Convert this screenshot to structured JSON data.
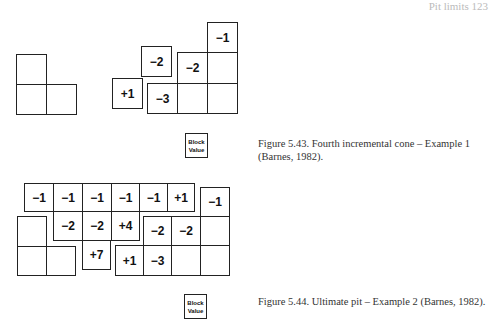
{
  "page_header": "Pit limits 123",
  "figure_1": {
    "caption": "Figure 5.43.  Fourth incremental cone – Example 1 (Barnes, 1982).",
    "legend": {
      "line1": "Block",
      "line2": "Value"
    },
    "cells": [
      {
        "x": 16,
        "y": 54,
        "w": 31,
        "h": 31,
        "label": ""
      },
      {
        "x": 16,
        "y": 84,
        "w": 31,
        "h": 31,
        "label": ""
      },
      {
        "x": 46,
        "y": 84,
        "w": 31,
        "h": 31,
        "label": ""
      },
      {
        "x": 112,
        "y": 78,
        "w": 31,
        "h": 31,
        "label": "+1"
      },
      {
        "x": 141,
        "y": 46,
        "w": 31,
        "h": 31,
        "label": "−2"
      },
      {
        "x": 147,
        "y": 83,
        "w": 31,
        "h": 31,
        "label": "−3"
      },
      {
        "x": 177,
        "y": 52,
        "w": 31,
        "h": 32,
        "label": "−2"
      },
      {
        "x": 177,
        "y": 83,
        "w": 31,
        "h": 31,
        "label": ""
      },
      {
        "x": 207,
        "y": 22,
        "w": 31,
        "h": 31,
        "label": "−1"
      },
      {
        "x": 207,
        "y": 52,
        "w": 31,
        "h": 32,
        "label": ""
      },
      {
        "x": 207,
        "y": 83,
        "w": 31,
        "h": 31,
        "label": ""
      }
    ]
  },
  "figure_2": {
    "caption": "Figure 5.44.  Ultimate pit – Example 2 (Barnes, 1982).",
    "legend": {
      "line1": "Block",
      "line2": "Value"
    },
    "cells": [
      {
        "x": 24,
        "y": 183,
        "w": 30,
        "h": 29,
        "label": "−1"
      },
      {
        "x": 53,
        "y": 183,
        "w": 30,
        "h": 29,
        "label": "−1"
      },
      {
        "x": 82,
        "y": 183,
        "w": 30,
        "h": 29,
        "label": "−1"
      },
      {
        "x": 111,
        "y": 183,
        "w": 29,
        "h": 29,
        "label": "−1"
      },
      {
        "x": 139,
        "y": 183,
        "w": 29,
        "h": 29,
        "label": "−1"
      },
      {
        "x": 167,
        "y": 183,
        "w": 28,
        "h": 29,
        "label": "+1"
      },
      {
        "x": 200,
        "y": 187,
        "w": 30,
        "h": 30,
        "label": "−1"
      },
      {
        "x": 17,
        "y": 216,
        "w": 30,
        "h": 31,
        "label": ""
      },
      {
        "x": 53,
        "y": 211,
        "w": 30,
        "h": 30,
        "label": "−2"
      },
      {
        "x": 82,
        "y": 211,
        "w": 30,
        "h": 30,
        "label": "−2"
      },
      {
        "x": 111,
        "y": 211,
        "w": 29,
        "h": 30,
        "label": "+4"
      },
      {
        "x": 143,
        "y": 216,
        "w": 29,
        "h": 30,
        "label": "−2"
      },
      {
        "x": 171,
        "y": 216,
        "w": 30,
        "h": 30,
        "label": "−2"
      },
      {
        "x": 200,
        "y": 216,
        "w": 30,
        "h": 30,
        "label": ""
      },
      {
        "x": 17,
        "y": 246,
        "w": 30,
        "h": 30,
        "label": ""
      },
      {
        "x": 46,
        "y": 246,
        "w": 30,
        "h": 30,
        "label": ""
      },
      {
        "x": 82,
        "y": 240,
        "w": 29,
        "h": 30,
        "label": "+7"
      },
      {
        "x": 115,
        "y": 245,
        "w": 29,
        "h": 31,
        "label": "+1"
      },
      {
        "x": 143,
        "y": 245,
        "w": 29,
        "h": 31,
        "label": "−3"
      },
      {
        "x": 171,
        "y": 245,
        "w": 30,
        "h": 31,
        "label": ""
      },
      {
        "x": 200,
        "y": 245,
        "w": 30,
        "h": 31,
        "label": ""
      }
    ]
  }
}
